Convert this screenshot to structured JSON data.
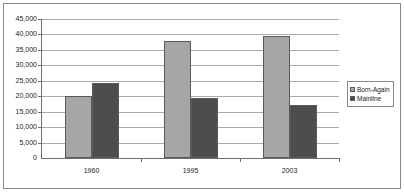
{
  "chart_data": {
    "type": "bar",
    "title": "",
    "subtitle": "",
    "xlabel": "",
    "ylabel": "",
    "categories": [
      "1960",
      "1995",
      "2003"
    ],
    "series": [
      {
        "name": "Born-Again",
        "color": "#a6a6a6",
        "values": [
          20000,
          38000,
          39500
        ]
      },
      {
        "name": "Mainline",
        "color": "#4d4d4d",
        "values": [
          24200,
          19500,
          17300
        ]
      }
    ],
    "ylim": [
      0,
      45000
    ],
    "ytick_values": [
      45000,
      40000,
      35000,
      30000,
      25000,
      20000,
      15000,
      10000,
      5000,
      0
    ],
    "ytick_labels": [
      "45,000",
      "40,000",
      "35,000",
      "30,000",
      "25,000",
      "20,000",
      "15,000",
      "10,000",
      "5,000",
      "0"
    ],
    "grid": true,
    "grid_axis": "y",
    "legend_position": "right",
    "legend_entries": [
      "Born-Again",
      "Mainline"
    ],
    "annotations": [],
    "plot_background": "#ffffff",
    "gridline_color": "#a9a9a9",
    "axis_color": "#6e6e6e",
    "frame_color": "#8a8a8a"
  }
}
